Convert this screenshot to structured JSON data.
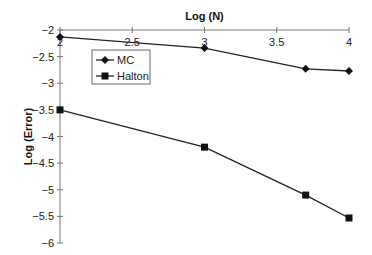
{
  "chart_data": {
    "type": "line",
    "title": "",
    "xlabel": "Log (N)",
    "ylabel": "Log (Error)",
    "xlim": [
      2,
      4
    ],
    "ylim": [
      -6,
      -2
    ],
    "x_ticks": [
      "2",
      "2.5",
      "3",
      "3.5",
      "4"
    ],
    "y_ticks": [
      "-2",
      "-2.5",
      "-3",
      "-3.5",
      "-4",
      "-4.5",
      "-5",
      "-5.5",
      "-6"
    ],
    "x_axis_position": "top",
    "grid": false,
    "legend_position": "upper-left-inside",
    "series": [
      {
        "name": "MC",
        "marker": "diamond",
        "x": [
          2,
          3,
          3.7,
          4
        ],
        "values": [
          -2.13,
          -2.34,
          -2.73,
          -2.77
        ]
      },
      {
        "name": "Halton",
        "marker": "square",
        "x": [
          2,
          3,
          3.7,
          4
        ],
        "values": [
          -3.5,
          -4.2,
          -5.1,
          -5.53
        ]
      }
    ]
  }
}
